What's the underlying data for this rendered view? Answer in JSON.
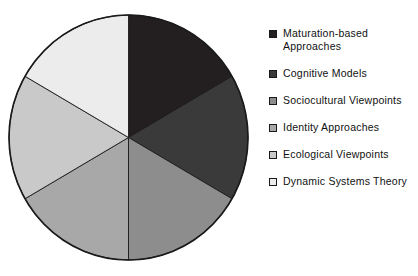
{
  "chart_data": {
    "type": "pie",
    "title": "",
    "subtitle": "",
    "xlabel": "",
    "ylabel": "",
    "grid": false,
    "legend_position": "right",
    "start_angle_deg": 0,
    "direction": "clockwise",
    "total": 100,
    "categories": [
      "Maturation-based Approaches",
      "Cognitive Models",
      "Sociocultural Viewpoints",
      "Identity Approaches",
      "Ecological Viewpoints",
      "Dynamic Systems Theory"
    ],
    "values": [
      16.67,
      16.67,
      16.67,
      16.67,
      16.67,
      16.67
    ],
    "slice_angles_deg": [
      60,
      60,
      60,
      60,
      60,
      60
    ],
    "colors": [
      "#231f20",
      "#3a3a3a",
      "#8d8d8d",
      "#a8a8a8",
      "#c9c9c9",
      "#ececec"
    ],
    "slices": [
      {
        "label": "Maturation-based Approaches",
        "value": 16.67,
        "angle_deg": 60,
        "color": "#231f20",
        "start_deg": 0,
        "end_deg": 60
      },
      {
        "label": "Cognitive Models",
        "value": 16.67,
        "angle_deg": 60,
        "color": "#3a3a3a",
        "start_deg": 60,
        "end_deg": 120
      },
      {
        "label": "Sociocultural Viewpoints",
        "value": 16.67,
        "angle_deg": 60,
        "color": "#8d8d8d",
        "start_deg": 120,
        "end_deg": 180
      },
      {
        "label": "Identity Approaches",
        "value": 16.67,
        "angle_deg": 60,
        "color": "#a8a8a8",
        "start_deg": 180,
        "end_deg": 240
      },
      {
        "label": "Ecological Viewpoints",
        "value": 16.67,
        "angle_deg": 60,
        "color": "#c9c9c9",
        "start_deg": 240,
        "end_deg": 300
      },
      {
        "label": "Dynamic Systems Theory",
        "value": 16.67,
        "angle_deg": 60,
        "color": "#ececec",
        "start_deg": 300,
        "end_deg": 360
      }
    ]
  },
  "legend": {
    "entries": [
      {
        "label": "Maturation-based\nApproaches",
        "color": "#231f20"
      },
      {
        "label": "Cognitive Models",
        "color": "#3a3a3a"
      },
      {
        "label": "Sociocultural Viewpoints",
        "color": "#8d8d8d"
      },
      {
        "label": "Identity Approaches",
        "color": "#a8a8a8"
      },
      {
        "label": "Ecological Viewpoints",
        "color": "#c9c9c9"
      },
      {
        "label": "Dynamic Systems Theory",
        "color": "#ececec"
      }
    ]
  },
  "style": {
    "background": "#ffffff",
    "outline": "#1a1a1a",
    "text": "#111111"
  }
}
